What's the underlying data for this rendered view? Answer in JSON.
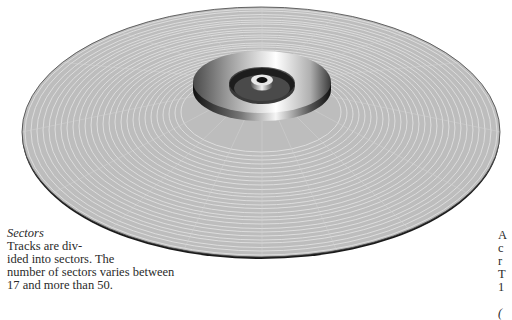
{
  "figure": {
    "colors": {
      "platter": "#bdbdbd",
      "track_line": "#e6e6e6",
      "edge": "#1a1a1a",
      "hub_light": "#f2f2f2",
      "hub_dark": "#2e2e2e",
      "recess": "#3a3a3a"
    }
  },
  "captions": {
    "left": {
      "title": "Sectors",
      "lines": [
        "Tracks are div-",
        "ided into sectors. The",
        "number of sectors varies between",
        "17 and more than 50."
      ]
    },
    "right": {
      "lines": [
        "A",
        "c",
        "r",
        "T",
        "1",
        "",
        "("
      ]
    }
  }
}
